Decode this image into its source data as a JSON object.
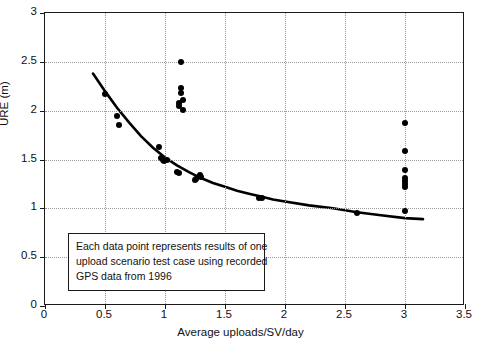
{
  "chart_data": {
    "type": "scatter",
    "title": "",
    "xlabel": "Average uploads/SV/day",
    "ylabel": "URE (m)",
    "xlim": [
      0,
      3.5
    ],
    "ylim": [
      0,
      3
    ],
    "xticks": [
      "0",
      "0.5",
      "1",
      "1.5",
      "2",
      "2.5",
      "3",
      "3.5"
    ],
    "xtick_values": [
      0,
      0.5,
      1,
      1.5,
      2,
      2.5,
      3,
      3.5
    ],
    "yticks": [
      "0",
      "0.5",
      "1",
      "1.5",
      "2",
      "2.5",
      "3"
    ],
    "ytick_values": [
      0,
      0.5,
      1,
      1.5,
      2,
      2.5,
      3
    ],
    "grid": "dotted",
    "legend": "none",
    "marker_color": "#000000",
    "curve_color": "#000000",
    "series": [
      {
        "name": "Upload scenario test cases",
        "points": [
          [
            0.5,
            2.17
          ],
          [
            0.6,
            1.95
          ],
          [
            0.62,
            1.85
          ],
          [
            0.95,
            1.63
          ],
          [
            0.97,
            1.52
          ],
          [
            0.98,
            1.5
          ],
          [
            0.99,
            1.48
          ],
          [
            1.02,
            1.5
          ],
          [
            1.1,
            1.37
          ],
          [
            1.12,
            1.36
          ],
          [
            1.13,
            2.5
          ],
          [
            1.13,
            2.23
          ],
          [
            1.13,
            2.18
          ],
          [
            1.12,
            2.08
          ],
          [
            1.12,
            2.05
          ],
          [
            1.15,
            2.11
          ],
          [
            1.15,
            2.01
          ],
          [
            1.25,
            1.29
          ],
          [
            1.26,
            1.3
          ],
          [
            1.29,
            1.34
          ],
          [
            1.3,
            1.32
          ],
          [
            1.78,
            1.11
          ],
          [
            1.81,
            1.11
          ],
          [
            2.6,
            0.95
          ],
          [
            3.0,
            1.87
          ],
          [
            3.0,
            1.59
          ],
          [
            3.0,
            1.39
          ],
          [
            3.0,
            1.31
          ],
          [
            3.0,
            1.28
          ],
          [
            3.0,
            1.25
          ],
          [
            3.0,
            1.22
          ],
          [
            3.0,
            0.97
          ]
        ]
      }
    ],
    "fit_curve": {
      "name": "Fitted decay trend",
      "x_start": 0.4,
      "x_end": 3.15,
      "points": [
        [
          0.4,
          2.38
        ],
        [
          0.5,
          2.2
        ],
        [
          0.6,
          2.03
        ],
        [
          0.7,
          1.88
        ],
        [
          0.8,
          1.74
        ],
        [
          0.9,
          1.62
        ],
        [
          1.0,
          1.52
        ],
        [
          1.1,
          1.44
        ],
        [
          1.2,
          1.37
        ],
        [
          1.3,
          1.31
        ],
        [
          1.4,
          1.26
        ],
        [
          1.5,
          1.22
        ],
        [
          1.6,
          1.18
        ],
        [
          1.7,
          1.15
        ],
        [
          1.8,
          1.12
        ],
        [
          1.9,
          1.09
        ],
        [
          2.0,
          1.07
        ],
        [
          2.2,
          1.03
        ],
        [
          2.4,
          1.0
        ],
        [
          2.6,
          0.96
        ],
        [
          2.8,
          0.93
        ],
        [
          3.0,
          0.9
        ],
        [
          3.15,
          0.89
        ]
      ]
    },
    "annotation": {
      "lines": [
        "Each data point represents results of one",
        "upload scenario test case using recorded",
        "GPS data from 1996"
      ]
    }
  }
}
